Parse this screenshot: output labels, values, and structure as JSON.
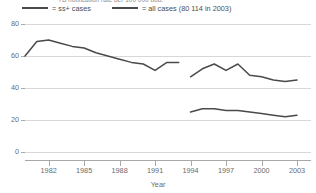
{
  "header": {
    "clipped_title": "TB notification rate per 100 000 pop."
  },
  "legend": {
    "position": "top",
    "entries": [
      {
        "swatch": "line-swatch",
        "label": "= ss+ cases"
      },
      {
        "swatch": "line-swatch",
        "label": "= all cases (80 114 in 2003)"
      }
    ]
  },
  "colors": {
    "line": "#4a4a4c",
    "grid": "#d8d8da",
    "axis": "#a8a8ab",
    "text": "#6b6b6e",
    "background": "#ffffff"
  },
  "chart_data": {
    "type": "line",
    "title": "TB notification rate per 100 000 pop.",
    "xlabel": "Year",
    "ylabel": "",
    "xlim": [
      1980,
      2003
    ],
    "ylim": [
      0,
      80
    ],
    "yticks": [
      0,
      20,
      40,
      60,
      80
    ],
    "xticks": [
      1982,
      1985,
      1988,
      1991,
      1994,
      1997,
      2000,
      2003
    ],
    "grid": true,
    "legend_position": "top",
    "series": [
      {
        "name": "ss+ cases",
        "segment": "1980-1993",
        "x": [
          1980,
          1981,
          1982,
          1983,
          1984,
          1985,
          1986,
          1987,
          1988,
          1989,
          1990,
          1991,
          1992,
          1993
        ],
        "values": [
          60,
          69,
          70,
          68,
          66,
          65,
          62,
          60,
          58,
          56,
          55,
          51,
          56,
          56
        ]
      },
      {
        "name": "all cases",
        "segment": "1994-2003",
        "x": [
          1994,
          1995,
          1996,
          1997,
          1998,
          1999,
          2000,
          2001,
          2002,
          2003
        ],
        "values": [
          47,
          52,
          55,
          51,
          55,
          48,
          47,
          45,
          44,
          45
        ]
      },
      {
        "name": "ss+ cases",
        "segment": "1994-2003",
        "x": [
          1994,
          1995,
          1996,
          1997,
          1998,
          1999,
          2000,
          2001,
          2002,
          2003
        ],
        "values": [
          25,
          27,
          27,
          26,
          26,
          25,
          24,
          23,
          22,
          23
        ]
      }
    ]
  }
}
